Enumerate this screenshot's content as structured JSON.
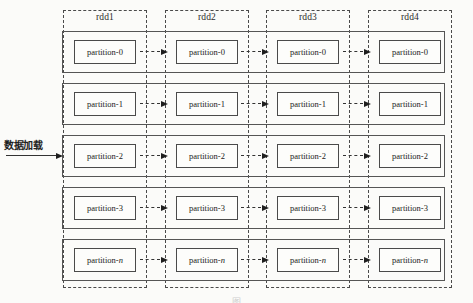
{
  "diagram": {
    "background_color": "#fbfbf9",
    "line_color": "#4a4a4a",
    "input_arrow": {
      "label": "数据加载",
      "target_row": "partition-2",
      "style": "solid"
    },
    "connector_style": "dashed-arrow",
    "columns": [
      {
        "label": "rdd1"
      },
      {
        "label": "rdd2"
      },
      {
        "label": "rdd3"
      },
      {
        "label": "rdd4"
      }
    ],
    "rows": [
      {
        "prefix": "partition-",
        "suffix": "0",
        "italic_suffix": false
      },
      {
        "prefix": "partition-",
        "suffix": "1",
        "italic_suffix": false
      },
      {
        "prefix": "partition-",
        "suffix": "2",
        "italic_suffix": false
      },
      {
        "prefix": "partition-",
        "suffix": "3",
        "italic_suffix": false
      },
      {
        "prefix": "partition-",
        "suffix": "n",
        "italic_suffix": true
      }
    ],
    "caption": "图"
  }
}
